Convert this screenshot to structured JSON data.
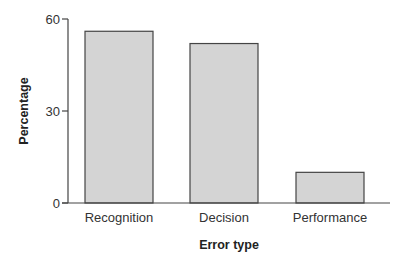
{
  "chart_data": {
    "type": "bar",
    "title": "",
    "xlabel": "Error type",
    "ylabel": "Percentage",
    "categories": [
      "Recognition",
      "Decision",
      "Performance"
    ],
    "values": [
      56,
      52,
      10
    ],
    "ylim": [
      0,
      60
    ],
    "yticks": [
      0,
      30,
      60
    ],
    "grid": false,
    "legend": null,
    "bar_color": "#d4d4d4",
    "bar_edge_color": "#444444"
  }
}
